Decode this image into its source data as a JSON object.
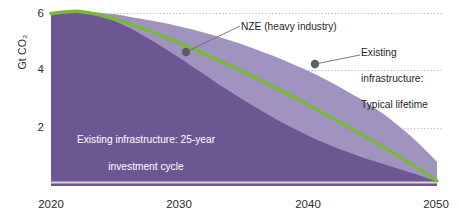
{
  "chart_data": {
    "type": "area",
    "title": "",
    "subtitle": "",
    "xlabel": "",
    "ylabel": "Gt CO₂",
    "xlim": [
      2020,
      2050
    ],
    "ylim": [
      0,
      6.4
    ],
    "grid": "dotted horizontal gridlines at 2, 4 and 6",
    "legend_position": "inline annotations",
    "x_ticks": [
      "2020",
      "2030",
      "2040",
      "2050"
    ],
    "x_tick_values": [
      2020,
      2030,
      2040,
      2050
    ],
    "y_ticks": [
      "2",
      "4",
      "6"
    ],
    "y_tick_values": [
      2,
      4,
      6
    ],
    "x": [
      2020,
      2021,
      2022,
      2023,
      2024,
      2025,
      2026,
      2027,
      2028,
      2029,
      2030,
      2031,
      2032,
      2033,
      2034,
      2035,
      2036,
      2037,
      2038,
      2039,
      2040,
      2041,
      2042,
      2043,
      2044,
      2045,
      2046,
      2047,
      2048,
      2049,
      2050
    ],
    "series": [
      {
        "name": "Existing infrastructure: Typical lifetime",
        "type": "area",
        "color": "#a193c0",
        "values": [
          6.0,
          6.04,
          6.08,
          6.06,
          6.02,
          5.97,
          5.9,
          5.82,
          5.74,
          5.65,
          5.55,
          5.44,
          5.32,
          5.19,
          5.05,
          4.9,
          4.74,
          4.57,
          4.39,
          4.2,
          4.0,
          3.78,
          3.55,
          3.3,
          3.04,
          2.76,
          2.45,
          2.1,
          1.72,
          1.3,
          0.85
        ]
      },
      {
        "name": "Existing infrastructure: 25-year investment cycle",
        "type": "area",
        "color": "#6d5793",
        "values": [
          6.0,
          6.04,
          6.06,
          6.0,
          5.88,
          5.72,
          5.52,
          5.28,
          5.02,
          4.74,
          4.45,
          4.15,
          3.85,
          3.55,
          3.26,
          2.98,
          2.71,
          2.45,
          2.2,
          1.97,
          1.75,
          1.55,
          1.36,
          1.19,
          1.03,
          0.88,
          0.74,
          0.6,
          0.46,
          0.31,
          0.15
        ]
      },
      {
        "name": "NZE (heavy industry)",
        "type": "line",
        "color": "#7cb73a",
        "values": [
          6.0,
          6.05,
          6.08,
          6.02,
          5.92,
          5.8,
          5.66,
          5.5,
          5.33,
          5.15,
          4.97,
          4.78,
          4.58,
          4.38,
          4.17,
          3.96,
          3.74,
          3.52,
          3.29,
          3.06,
          2.82,
          2.58,
          2.33,
          2.08,
          1.83,
          1.57,
          1.31,
          1.04,
          0.77,
          0.48,
          0.18
        ]
      }
    ],
    "annotations": [
      {
        "id": "nze-callout",
        "label": "NZE (heavy industry)",
        "marker_x": 2031.2,
        "marker_y": 4.78,
        "marker_color": "#5d5d66"
      },
      {
        "id": "typical-lifetime-callout",
        "label": "Existing\ninfrastructure:\nTypical lifetime",
        "marker_x": 2040.7,
        "marker_y": 4.24,
        "marker_color": "#5d5d66"
      },
      {
        "id": "investment-cycle-label",
        "label": "Existing infrastructure: 25-year\ninvestment cycle",
        "text_color": "#ffffff"
      }
    ],
    "colors": {
      "area_typical_lifetime": "#a193c0",
      "area_investment_cycle": "#6d5793",
      "nze_line": "#7cb73a",
      "gridline": "#b9b4c4",
      "marker": "#5d5d66",
      "baseline_rule": "#d9cfc9",
      "tick_text": "#2b2b2b"
    }
  },
  "axis": {
    "ylabel": "Gt CO₂",
    "y_ticks": [
      "6",
      "4",
      "2"
    ],
    "x_ticks": [
      "2020",
      "2030",
      "2040",
      "2050"
    ]
  },
  "annotations": {
    "nze": "NZE (heavy industry)",
    "typical_lifetime_line1": "Existing",
    "typical_lifetime_line2": "infrastructure:",
    "typical_lifetime_line3": "Typical lifetime",
    "investment_cycle_line1": "Existing infrastructure: 25-year",
    "investment_cycle_line2": "investment cycle"
  }
}
